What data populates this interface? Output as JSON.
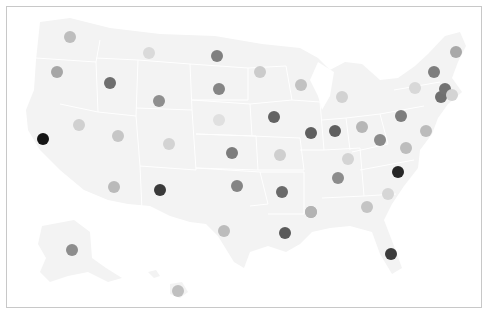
{
  "map": {
    "type": "us-states-dot-map",
    "land_color": "#f3f3f3",
    "border_color": "#ffffff",
    "frame_color": "#c8c8c8",
    "dot_radius": 6
  },
  "chart_data": {
    "type": "scatter",
    "title": "",
    "encoding": "grayscale dot per state (darker = higher value)",
    "points": [
      {
        "state": "WA",
        "x": 70,
        "y": 37,
        "color": "#bdbdbd"
      },
      {
        "state": "OR",
        "x": 57,
        "y": 72,
        "color": "#a6a6a6"
      },
      {
        "state": "CA",
        "x": 43,
        "y": 139,
        "color": "#141414"
      },
      {
        "state": "NV",
        "x": 79,
        "y": 125,
        "color": "#d0d0d0"
      },
      {
        "state": "ID",
        "x": 110,
        "y": 83,
        "color": "#6e6e6e"
      },
      {
        "state": "MT",
        "x": 149,
        "y": 53,
        "color": "#dadada"
      },
      {
        "state": "WY",
        "x": 159,
        "y": 101,
        "color": "#8f8f8f"
      },
      {
        "state": "UT",
        "x": 118,
        "y": 136,
        "color": "#c6c6c6"
      },
      {
        "state": "AZ",
        "x": 114,
        "y": 187,
        "color": "#bababa"
      },
      {
        "state": "CO",
        "x": 169,
        "y": 144,
        "color": "#d3d3d3"
      },
      {
        "state": "NM",
        "x": 160,
        "y": 190,
        "color": "#3a3a3a"
      },
      {
        "state": "ND",
        "x": 217,
        "y": 56,
        "color": "#808080"
      },
      {
        "state": "SD",
        "x": 219,
        "y": 89,
        "color": "#858585"
      },
      {
        "state": "NE",
        "x": 219,
        "y": 120,
        "color": "#e0e0e0"
      },
      {
        "state": "KS",
        "x": 232,
        "y": 153,
        "color": "#7c7c7c"
      },
      {
        "state": "OK",
        "x": 237,
        "y": 186,
        "color": "#858585"
      },
      {
        "state": "TX",
        "x": 224,
        "y": 231,
        "color": "#bcbcbc"
      },
      {
        "state": "MN",
        "x": 260,
        "y": 72,
        "color": "#cbcbcb"
      },
      {
        "state": "IA",
        "x": 274,
        "y": 117,
        "color": "#636363"
      },
      {
        "state": "MO",
        "x": 280,
        "y": 155,
        "color": "#cfcfcf"
      },
      {
        "state": "AR",
        "x": 282,
        "y": 192,
        "color": "#6a6a6a"
      },
      {
        "state": "LA",
        "x": 285,
        "y": 233,
        "color": "#5a5a5a"
      },
      {
        "state": "WI",
        "x": 301,
        "y": 85,
        "color": "#c2c2c2"
      },
      {
        "state": "IL",
        "x": 311,
        "y": 133,
        "color": "#5f5f5f"
      },
      {
        "state": "MS",
        "x": 311,
        "y": 212,
        "color": "#b3b3b3"
      },
      {
        "state": "MI",
        "x": 342,
        "y": 97,
        "color": "#d2d2d2"
      },
      {
        "state": "IN",
        "x": 335,
        "y": 131,
        "color": "#606060"
      },
      {
        "state": "KY",
        "x": 348,
        "y": 159,
        "color": "#d4d4d4"
      },
      {
        "state": "OH",
        "x": 362,
        "y": 127,
        "color": "#b6b6b6"
      },
      {
        "state": "TN",
        "x": 338,
        "y": 178,
        "color": "#8c8c8c"
      },
      {
        "state": "AL",
        "x": 311,
        "y": 212,
        "color": "#b3b3b3"
      },
      {
        "state": "GA",
        "x": 367,
        "y": 207,
        "color": "#c4c4c4"
      },
      {
        "state": "FL",
        "x": 391,
        "y": 254,
        "color": "#3c3c3c"
      },
      {
        "state": "SC",
        "x": 388,
        "y": 194,
        "color": "#d6d6d6"
      },
      {
        "state": "NC",
        "x": 398,
        "y": 172,
        "color": "#262626"
      },
      {
        "state": "VA",
        "x": 406,
        "y": 148,
        "color": "#bdbdbd"
      },
      {
        "state": "WV",
        "x": 380,
        "y": 140,
        "color": "#8a8a8a"
      },
      {
        "state": "PA",
        "x": 401,
        "y": 116,
        "color": "#7d7d7d"
      },
      {
        "state": "NY",
        "x": 415,
        "y": 88,
        "color": "#d8d8d8"
      },
      {
        "state": "MD",
        "x": 426,
        "y": 131,
        "color": "#bbbbbb"
      },
      {
        "state": "NJ",
        "x": 441,
        "y": 97,
        "color": "#6f6f6f"
      },
      {
        "state": "CT",
        "x": 445,
        "y": 89,
        "color": "#727272"
      },
      {
        "state": "RI",
        "x": 452,
        "y": 95,
        "color": "#d4d4d4"
      },
      {
        "state": "VT",
        "x": 434,
        "y": 72,
        "color": "#7e7e7e"
      },
      {
        "state": "ME",
        "x": 456,
        "y": 52,
        "color": "#a8a8a8"
      },
      {
        "state": "AK",
        "x": 72,
        "y": 250,
        "color": "#8d8d8d"
      },
      {
        "state": "HI",
        "x": 178,
        "y": 291,
        "color": "#c0c0c0"
      }
    ]
  }
}
